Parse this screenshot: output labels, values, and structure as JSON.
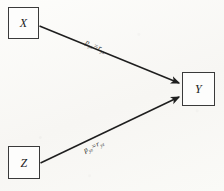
{
  "diagram": {
    "type": "path-diagram",
    "title": "",
    "background_color": "#fbfaf8",
    "line_color": "#1e1e1e",
    "nodes": [
      {
        "id": "x",
        "label": "X",
        "shape": "rectangle",
        "position": "top-left"
      },
      {
        "id": "y",
        "label": "Y",
        "shape": "rectangle",
        "position": "middle-right"
      },
      {
        "id": "z",
        "label": "Z",
        "shape": "rectangle",
        "position": "bottom-left"
      }
    ],
    "edges": [
      {
        "id": "x-to-y",
        "from": "X",
        "to": "Y",
        "arrow": "single",
        "label": {
          "coefficient": "p",
          "coefficient_subscript": "yx",
          "equals": "=",
          "correlation": "r",
          "correlation_subscript": "yx",
          "full_text": "p yx = r yx"
        }
      },
      {
        "id": "z-to-y",
        "from": "Z",
        "to": "Y",
        "arrow": "single",
        "label": {
          "coefficient": "p",
          "coefficient_subscript": "yz",
          "equals": "=",
          "correlation": "r",
          "correlation_subscript": "yz",
          "full_text": "p yz = r yz"
        }
      }
    ]
  }
}
